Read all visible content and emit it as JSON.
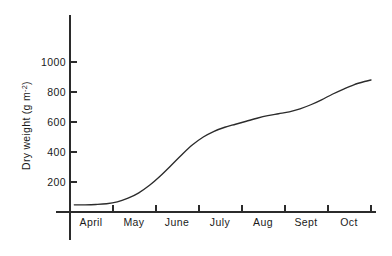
{
  "chart_data": {
    "type": "line",
    "title": "",
    "xlabel": "",
    "ylabel": "Dry weight (g m⁻²)",
    "ylabel_main": "Dry weight (g m",
    "ylabel_sup": "-2",
    "ylabel_close": ")",
    "grid": false,
    "legend": "none",
    "xlim": [
      0,
      7
    ],
    "ylim": [
      0,
      1000
    ],
    "x_tick_labels": [
      "April",
      "May",
      "June",
      "July",
      "Aug",
      "Sept",
      "Oct"
    ],
    "x_tick_positions": [
      0.5,
      1.5,
      2.5,
      3.5,
      4.5,
      5.5,
      6.5
    ],
    "x_tick_marks": [
      1,
      2,
      3,
      4,
      5,
      6,
      7
    ],
    "y_ticks": [
      200,
      400,
      600,
      800,
      1000
    ],
    "y_tick_labels": [
      "200",
      "400",
      "600",
      "800",
      "1000"
    ],
    "series": [
      {
        "name": "Dry weight",
        "color": "#2b2b2b",
        "x": [
          0.1,
          0.35,
          0.6,
          0.85,
          1.1,
          1.35,
          1.6,
          1.85,
          2.1,
          2.35,
          2.6,
          2.85,
          3.1,
          3.35,
          3.6,
          3.85,
          4.1,
          4.35,
          4.6,
          4.85,
          5.1,
          5.35,
          5.6,
          5.85,
          6.1,
          6.35,
          6.6,
          6.85,
          7.0
        ],
        "y": [
          48,
          48,
          50,
          55,
          68,
          92,
          128,
          178,
          240,
          310,
          382,
          448,
          500,
          538,
          565,
          585,
          605,
          625,
          642,
          655,
          668,
          688,
          715,
          748,
          785,
          818,
          848,
          870,
          880
        ]
      }
    ],
    "curve_start_value": 48,
    "curve_end_value": 880,
    "curve_shape": "sigmoid with mid-season plateau around August"
  },
  "figure": {
    "background_color": "#ffffff",
    "axis_color": "#2b2b2b",
    "line_color": "#2b2b2b"
  }
}
